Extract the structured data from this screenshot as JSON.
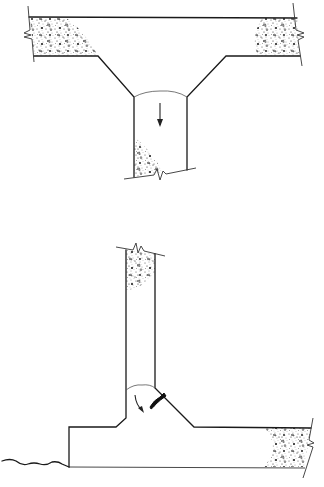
{
  "figure": {
    "panels": [
      {
        "id": "top",
        "name": "slab-column-joint-hanging",
        "description": "Haunched T-joint with column below slab; arrow downward",
        "arrow_direction": "down"
      },
      {
        "id": "bottom",
        "name": "wall-footing-joint",
        "description": "Wall on footing with haunch; curved arrow and crack at re-entrant corner",
        "arrow_direction": "curved-down-right"
      }
    ],
    "colors": {
      "line": "#1a1a1a",
      "background": "#ffffff",
      "stipple": "#2a2a2a"
    }
  }
}
